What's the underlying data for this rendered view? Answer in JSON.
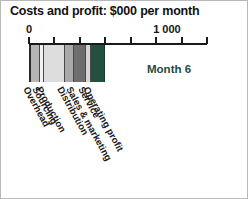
{
  "chart_data": {
    "type": "bar",
    "orientation": "horizontal-stacked",
    "title": "Costs and profit: $000 per month",
    "xlabel": "",
    "ylabel": "",
    "annotation": "Month 6",
    "annotation_color": "#1f4c3f",
    "grid": false,
    "legend_position": "none",
    "xlim": [
      0,
      1400
    ],
    "axis_ticks": [
      {
        "value": 0,
        "label": "0",
        "show_label": true
      },
      {
        "value": 200,
        "label": "",
        "show_label": false
      },
      {
        "value": 400,
        "label": "",
        "show_label": false
      },
      {
        "value": 600,
        "label": "",
        "show_label": false
      },
      {
        "value": 800,
        "label": "",
        "show_label": false
      },
      {
        "value": 1000,
        "label": "1 000",
        "show_label": true
      },
      {
        "value": 1200,
        "label": "",
        "show_label": false
      },
      {
        "value": 1400,
        "label": "",
        "show_label": false
      }
    ],
    "categories": [
      "Overhead",
      "Sourcing",
      "Production",
      "Distribution",
      "Sales & marketing",
      "Service",
      "Operating profit"
    ],
    "values": [
      70,
      30,
      170,
      70,
      90,
      45,
      105
    ],
    "colors": [
      "#b5b5b5",
      "#f2f2f2",
      "#dddddd",
      "#a9a9a9",
      "#6e6e6e",
      "#d6d6d6",
      "#23503f"
    ],
    "total": 580
  },
  "segments": [
    {
      "label": "Overhead",
      "value": 70,
      "color": "#b5b5b5"
    },
    {
      "label": "Sourcing",
      "value": 30,
      "color": "#f2f2f2"
    },
    {
      "label": "Production",
      "value": 170,
      "color": "#dddddd"
    },
    {
      "label": "Distribution",
      "value": 70,
      "color": "#a9a9a9"
    },
    {
      "label": "Sales & marketing",
      "value": 90,
      "color": "#6e6e6e"
    },
    {
      "label": "Service",
      "value": 45,
      "color": "#d6d6d6"
    },
    {
      "label": "Operating profit",
      "value": 105,
      "color": "#23503f"
    }
  ],
  "theme": {
    "background": "#ffffff",
    "axis_color": "#1a1a1a",
    "text_color": "#111111",
    "accent": "#23503f"
  }
}
